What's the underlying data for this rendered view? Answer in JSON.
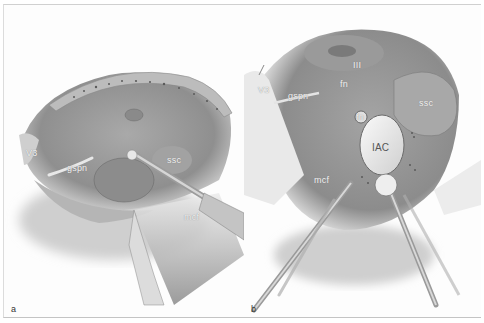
{
  "figure": {
    "panels": [
      {
        "id": "a",
        "letter": "a",
        "labels": {
          "v3": "V3",
          "gspn": "gspn",
          "ssc": "ssc",
          "mcf": "mcf"
        }
      },
      {
        "id": "b",
        "letter": "b",
        "labels": {
          "v3": "V3",
          "gspn": "gspn",
          "iii": "III",
          "fn_upper": "fn",
          "fn": "fn",
          "ssc": "ssc",
          "iac": "IAC",
          "mcf": "mcf"
        }
      }
    ],
    "colors": {
      "background": "#ffffff",
      "tissue": "#9c9c9c",
      "tissue_dark": "#6e6e6e",
      "bone_rim": "#bdbdbd",
      "instrument": "#c8c8c8",
      "label_text": "#f2f2f2"
    }
  }
}
